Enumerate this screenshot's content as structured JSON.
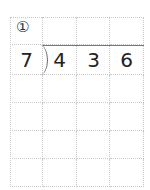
{
  "problem": {
    "number_label": "①",
    "divisor": "7",
    "dividend_digits": [
      "4",
      "3",
      "6"
    ]
  },
  "grid": {
    "columns": 4,
    "rows": 6,
    "line_color": "#c8c8c8"
  }
}
